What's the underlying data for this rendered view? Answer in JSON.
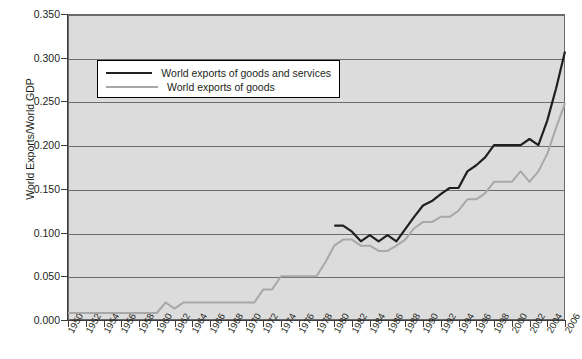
{
  "chart_data": {
    "type": "line",
    "title": "",
    "xlabel": "",
    "ylabel": "World Exports/World GDP",
    "xlim": [
      1950,
      2006
    ],
    "ylim": [
      0.0,
      0.35
    ],
    "grid": true,
    "legend_position": "upper-left-inside",
    "ytick_labels": [
      "0.000",
      "0.050",
      "0.100",
      "0.150",
      "0.200",
      "0.250",
      "0.300",
      "0.350"
    ],
    "ytick_values": [
      0.0,
      0.05,
      0.1,
      0.15,
      0.2,
      0.25,
      0.3,
      0.35
    ],
    "xtick_labels": [
      "1950",
      "1952",
      "1954",
      "1956",
      "1958",
      "1960",
      "1962",
      "1964",
      "1966",
      "1968",
      "1970",
      "1972",
      "1974",
      "1976",
      "1978",
      "1980",
      "1982",
      "1984",
      "1986",
      "1988",
      "1990",
      "1992",
      "1994",
      "1996",
      "1998",
      "2000",
      "2002",
      "2004",
      "2006"
    ],
    "x": [
      1950,
      1951,
      1952,
      1953,
      1954,
      1955,
      1956,
      1957,
      1958,
      1959,
      1960,
      1961,
      1962,
      1963,
      1964,
      1965,
      1966,
      1967,
      1968,
      1969,
      1970,
      1971,
      1972,
      1973,
      1974,
      1975,
      1976,
      1977,
      1978,
      1979,
      1980,
      1981,
      1982,
      1983,
      1984,
      1985,
      1986,
      1987,
      1988,
      1989,
      1990,
      1991,
      1992,
      1993,
      1994,
      1995,
      1996,
      1997,
      1998,
      1999,
      2000,
      2001,
      2002,
      2003,
      2004,
      2005,
      2006
    ],
    "series": [
      {
        "name": "World exports of goods and services",
        "color": "#231f20",
        "values": [
          null,
          null,
          null,
          null,
          null,
          null,
          null,
          null,
          null,
          null,
          null,
          null,
          null,
          null,
          null,
          null,
          null,
          null,
          null,
          null,
          null,
          null,
          null,
          null,
          null,
          null,
          null,
          null,
          null,
          null,
          0.108,
          0.108,
          0.101,
          0.09,
          0.097,
          0.09,
          0.097,
          0.09,
          0.104,
          0.118,
          0.131,
          0.136,
          0.144,
          0.151,
          0.151,
          0.17,
          0.177,
          0.186,
          0.2,
          0.2,
          0.2,
          0.2,
          0.207,
          0.2,
          0.228,
          0.265,
          0.307
        ]
      },
      {
        "name": "World exports of goods",
        "color": "#a8a8a8",
        "values": [
          0.008,
          0.008,
          0.008,
          0.008,
          0.008,
          0.008,
          0.008,
          0.008,
          0.008,
          0.008,
          0.008,
          0.02,
          0.013,
          0.02,
          0.02,
          0.02,
          0.02,
          0.02,
          0.02,
          0.02,
          0.02,
          0.02,
          0.035,
          0.035,
          0.05,
          0.05,
          0.05,
          0.05,
          0.05,
          0.066,
          0.085,
          0.092,
          0.092,
          0.085,
          0.085,
          0.079,
          0.079,
          0.085,
          0.092,
          0.105,
          0.112,
          0.112,
          0.118,
          0.118,
          0.125,
          0.138,
          0.138,
          0.145,
          0.158,
          0.158,
          0.158,
          0.17,
          0.158,
          0.17,
          0.19,
          0.22,
          0.248
        ]
      }
    ]
  },
  "legend": {
    "entries": [
      {
        "label": "World exports of goods and services",
        "swatch": "dark-line-swatch"
      },
      {
        "label": "World exports of goods",
        "swatch": "gray-line-swatch"
      }
    ]
  },
  "axes": {
    "y_title": "World Exports/World GDP"
  }
}
